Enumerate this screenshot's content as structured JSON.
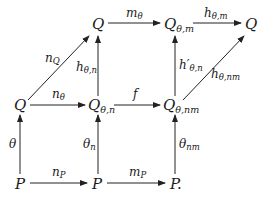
{
  "diagram": {
    "type": "commutative-diagram",
    "nodes": {
      "top_q": {
        "base": "Q",
        "sub": ""
      },
      "top_q_theta_m": {
        "base": "Q",
        "sub": "θ,m"
      },
      "top_q_right": {
        "base": "Q",
        "sub": ""
      },
      "mid_q": {
        "base": "Q",
        "sub": ""
      },
      "mid_q_theta_n": {
        "base": "Q",
        "sub": "θ,n"
      },
      "mid_q_theta_nm": {
        "base": "Q",
        "sub": "θ,nm"
      },
      "bot_p": {
        "base": "P",
        "sub": ""
      },
      "bot_p_mid": {
        "base": "P",
        "sub": ""
      },
      "bot_p_right": {
        "base": "P.",
        "sub": ""
      }
    },
    "arrows": {
      "m_theta": {
        "base": "m",
        "sub": "θ"
      },
      "h_theta_m": {
        "base": "h",
        "sub": "θ,m"
      },
      "n_q": {
        "base": "n",
        "sub": "Q"
      },
      "h_theta_n": {
        "base": "h",
        "sub": "θ,n"
      },
      "h_prime_theta_n": {
        "base": "h′",
        "sub": "θ,n"
      },
      "h_theta_nm": {
        "base": "h",
        "sub": "θ,nm"
      },
      "n_theta": {
        "base": "n",
        "sub": "θ"
      },
      "f": {
        "base": "f",
        "sub": ""
      },
      "theta": {
        "base": "θ",
        "sub": ""
      },
      "theta_n": {
        "base": "θ",
        "sub": "n"
      },
      "theta_nm": {
        "base": "θ",
        "sub": "nm"
      },
      "n_p": {
        "base": "n",
        "sub": "P"
      },
      "m_p": {
        "base": "m",
        "sub": "P"
      }
    }
  }
}
